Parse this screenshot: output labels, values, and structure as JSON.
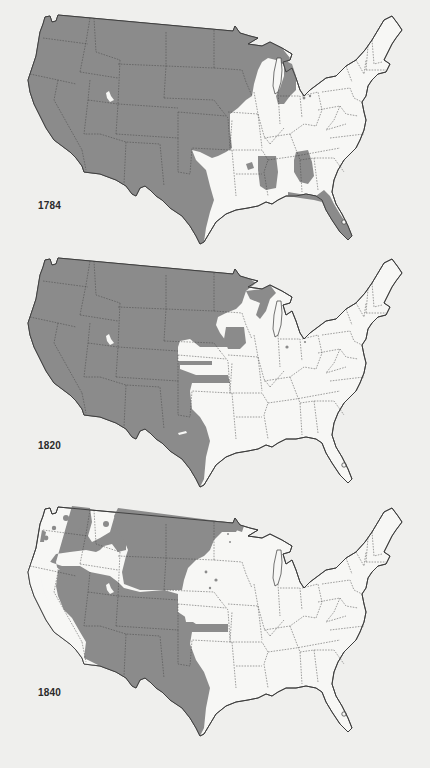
{
  "page": {
    "background": "#efefed",
    "shade_color": "#8b8b8b",
    "land_color": "#f7f7f5"
  },
  "maps": [
    {
      "id": "map-1784",
      "year_label": "1784"
    },
    {
      "id": "map-1820",
      "year_label": "1820"
    },
    {
      "id": "map-1840",
      "year_label": "1840"
    }
  ]
}
